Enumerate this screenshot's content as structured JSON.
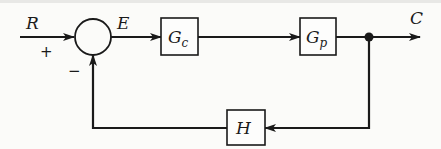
{
  "diagram": {
    "type": "feedback-control-block-diagram",
    "signals": {
      "input": "R",
      "error": "E",
      "output": "C"
    },
    "summing_junction": {
      "plus_sign": "+",
      "minus_sign": "−"
    },
    "blocks": {
      "controller": {
        "main": "G",
        "sub": "c"
      },
      "plant": {
        "main": "G",
        "sub": "p"
      },
      "feedback": {
        "main": "H"
      }
    },
    "colors": {
      "stroke": "#1a1a1a",
      "background": "#fbfbf9"
    }
  }
}
